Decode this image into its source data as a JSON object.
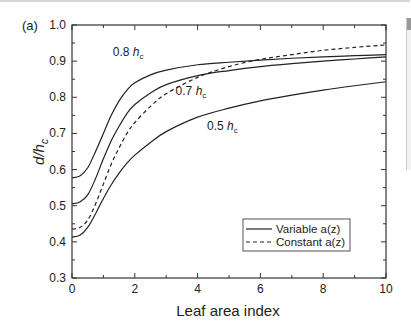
{
  "chart_data": {
    "type": "line",
    "panel_label": "(a)",
    "title": "",
    "xlabel": "Leaf area index",
    "ylabel": "d/h_c",
    "ylabel_main": "d/h",
    "ylabel_sub": "c",
    "xlim": [
      0,
      10
    ],
    "ylim": [
      0.3,
      1.0
    ],
    "xticks": [
      0,
      2,
      4,
      6,
      8,
      10
    ],
    "yticks": [
      0.3,
      0.4,
      0.5,
      0.6,
      0.7,
      0.8,
      0.9,
      1.0
    ],
    "xtick_labels": [
      "0",
      "2",
      "4",
      "6",
      "8",
      "10"
    ],
    "ytick_labels": [
      "0.3",
      "0.4",
      "0.5",
      "0.6",
      "0.7",
      "0.8",
      "0.9",
      "1.0"
    ],
    "grid": false,
    "legend_position": "lower right",
    "legend": [
      {
        "label": "Variable a(z)",
        "style": "solid"
      },
      {
        "label": "Constant a(z)",
        "style": "dashed"
      }
    ],
    "annotations": [
      {
        "text": "0.8",
        "sub": "c",
        "italic": "h",
        "x": 1.3,
        "y": 0.915
      },
      {
        "text": "0.7",
        "sub": "c",
        "italic": "h",
        "x": 3.3,
        "y": 0.805
      },
      {
        "text": "0.5",
        "sub": "c",
        "italic": "h",
        "x": 4.3,
        "y": 0.71
      }
    ],
    "series": [
      {
        "name": "Variable a(z), 0.8 h_c",
        "style": "solid",
        "x": [
          0,
          0.25,
          0.5,
          0.75,
          1,
          1.25,
          1.5,
          1.75,
          2,
          2.5,
          3,
          4,
          5,
          6,
          7,
          8,
          9,
          10
        ],
        "y": [
          0.577,
          0.582,
          0.605,
          0.65,
          0.7,
          0.75,
          0.79,
          0.82,
          0.84,
          0.862,
          0.875,
          0.89,
          0.897,
          0.903,
          0.908,
          0.912,
          0.915,
          0.918
        ]
      },
      {
        "name": "Variable a(z), 0.7 h_c",
        "style": "solid",
        "x": [
          0,
          0.25,
          0.5,
          0.75,
          1,
          1.25,
          1.5,
          1.75,
          2,
          2.5,
          3,
          4,
          5,
          6,
          7,
          8,
          9,
          10
        ],
        "y": [
          0.505,
          0.51,
          0.53,
          0.575,
          0.63,
          0.68,
          0.72,
          0.755,
          0.78,
          0.812,
          0.835,
          0.86,
          0.874,
          0.885,
          0.893,
          0.9,
          0.906,
          0.912
        ]
      },
      {
        "name": "Constant a(z)",
        "style": "dashed",
        "x": [
          0,
          0.25,
          0.5,
          0.75,
          1,
          1.25,
          1.5,
          1.75,
          2,
          2.5,
          3,
          4,
          5,
          6,
          7,
          8,
          9,
          10
        ],
        "y": [
          0.435,
          0.44,
          0.46,
          0.505,
          0.56,
          0.615,
          0.66,
          0.7,
          0.73,
          0.775,
          0.81,
          0.855,
          0.885,
          0.905,
          0.918,
          0.93,
          0.938,
          0.945
        ]
      },
      {
        "name": "Variable a(z), 0.5 h_c",
        "style": "solid",
        "x": [
          0,
          0.25,
          0.5,
          0.75,
          1,
          1.25,
          1.5,
          1.75,
          2,
          2.5,
          3,
          4,
          5,
          6,
          7,
          8,
          9,
          10
        ],
        "y": [
          0.413,
          0.418,
          0.44,
          0.478,
          0.52,
          0.558,
          0.59,
          0.618,
          0.64,
          0.675,
          0.705,
          0.745,
          0.77,
          0.79,
          0.806,
          0.82,
          0.832,
          0.843
        ]
      }
    ]
  }
}
